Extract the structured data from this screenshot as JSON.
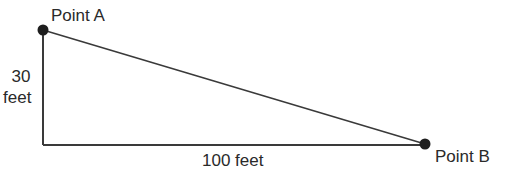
{
  "diagram": {
    "point_a": {
      "label": "Point A"
    },
    "point_b": {
      "label": "Point B"
    },
    "vertical_side": {
      "value": "30",
      "unit": "feet"
    },
    "horizontal_side": {
      "label": "100 feet"
    },
    "colors": {
      "line": "#3a3a3a",
      "point": "#1e1e1e",
      "text": "#2a2a2a"
    }
  }
}
